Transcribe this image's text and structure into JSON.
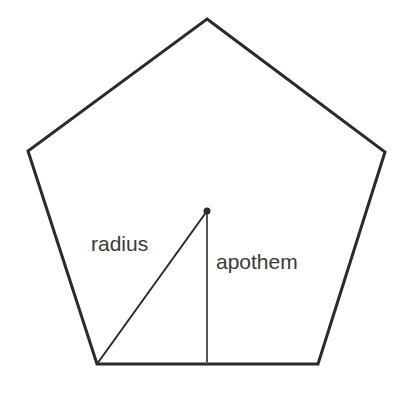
{
  "diagram": {
    "shape": "regular pentagon",
    "labels": {
      "radius": "radius",
      "apothem": "apothem"
    },
    "colors": {
      "stroke": "#2b2b2b",
      "text": "#3a3a3a",
      "background": "#ffffff"
    }
  }
}
